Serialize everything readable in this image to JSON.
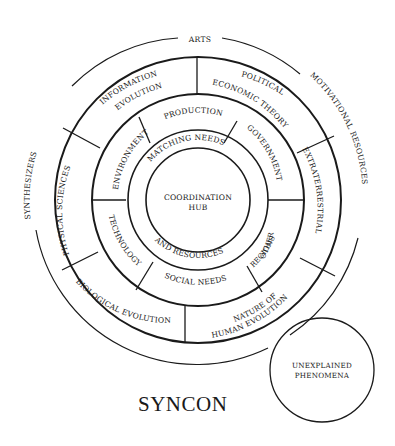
{
  "title": "SYNCON",
  "outer_labels": {
    "top": "ARTS",
    "left": "SYNTHESIZERS",
    "right": "MOTIVATIONAL RESOURCES"
  },
  "outer_ring": [
    {
      "line1": "INFORMATION",
      "line2": "EVOLUTION"
    },
    {
      "line1": "POLITICAL",
      "line2": "ECONOMIC THEORY"
    },
    {
      "line1": "EXTRATERRESTRIAL"
    },
    {
      "line1": "NATURE OF",
      "line2": "HUMAN EVOLUTION"
    },
    {
      "line1": "BIOLOGICAL EVOLUTION"
    },
    {
      "line1": "PHYSICAL SCIENCES"
    }
  ],
  "middle_ring": [
    {
      "line1": "PRODUCTION"
    },
    {
      "line1": "GOVERNMENT"
    },
    {
      "line1": "OTHER",
      "line2": "REGIONS"
    },
    {
      "line1": "SOCIAL NEEDS"
    },
    {
      "line1": "TECHNOLOGY"
    },
    {
      "line1": "ENVIRONMENT"
    }
  ],
  "inner_ring": {
    "top": "MATCHING NEEDS",
    "bottom": "AND RESOURCES"
  },
  "hub": {
    "line1": "COORDINATION",
    "line2": "HUB"
  },
  "satellite": {
    "line1": "UNEXPLAINED",
    "line2": "PHENOMENA"
  },
  "colors": {
    "ink": "#1a1a1a",
    "background": "#ffffff"
  }
}
